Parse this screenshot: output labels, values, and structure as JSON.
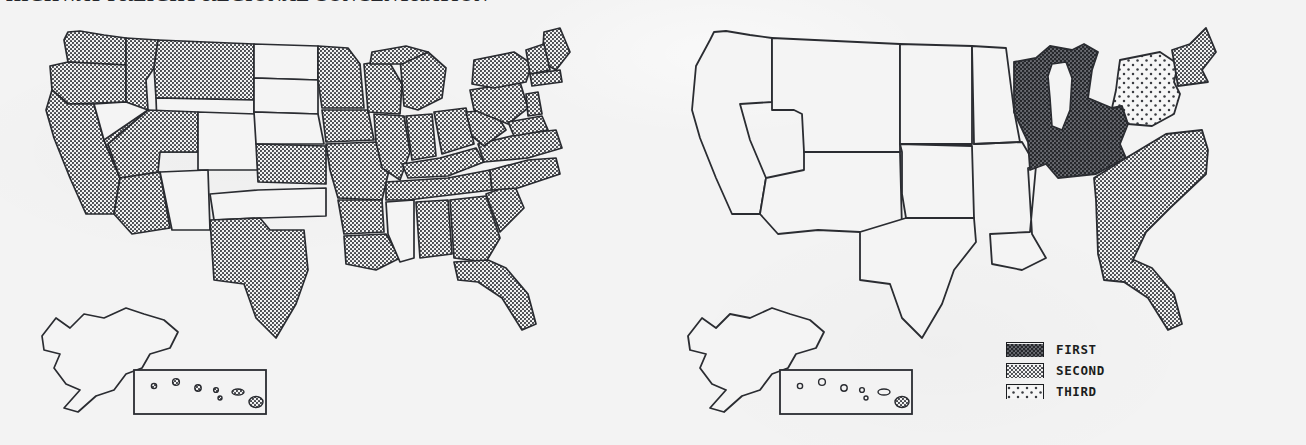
{
  "title": "HIGHWAY FREIGHT REGIONAL CONCENTRATION",
  "maps": [
    {
      "id": "map-all-regions",
      "name": "left-map",
      "description": "United States map with most states shaded in a uniform halftone dot pattern",
      "shaded_regions": [
        "Washington",
        "Oregon",
        "California",
        "Idaho",
        "Montana",
        "Arizona",
        "Utah",
        "Kansas",
        "Minnesota",
        "Iowa",
        "Missouri",
        "Arkansas",
        "Louisiana",
        "Texas",
        "Illinois",
        "Wisconsin",
        "Michigan",
        "Indiana",
        "Ohio",
        "Kentucky",
        "Tennessee",
        "Alabama",
        "Georgia",
        "Florida",
        "South Carolina",
        "North Carolina",
        "Virginia",
        "West Virginia",
        "Pennsylvania",
        "New York",
        "Maine",
        "Vermont",
        "New Hampshire",
        "Massachusetts",
        "New Jersey",
        "Maryland",
        "Delaware",
        "Connecticut",
        "Rhode Island",
        "Hawaii"
      ],
      "unshaded_regions": [
        "Nevada",
        "Wyoming",
        "Colorado",
        "New Mexico",
        "North Dakota",
        "South Dakota",
        "Nebraska",
        "Oklahoma",
        "Mississippi",
        "Alaska"
      ],
      "insets": [
        "Alaska",
        "Hawaii"
      ]
    },
    {
      "id": "map-ranked-regions",
      "name": "right-map",
      "description": "United States map with three ranked regions shaded by concentration order",
      "classified_regions": [
        {
          "rank": "FIRST",
          "pattern": "dense-dark-crosshatch",
          "area": "Great Lakes / East North Central"
        },
        {
          "rank": "SECOND",
          "pattern": "medium-dot",
          "area": "South Atlantic coast and Florida"
        },
        {
          "rank": "THIRD",
          "pattern": "sparse-dot",
          "area": "New York / Pennsylvania Mid-Atlantic"
        }
      ],
      "unshaded_regions": [
        "West",
        "Mountain",
        "Plains",
        "Alaska"
      ],
      "insets": [
        "Alaska",
        "Hawaii"
      ]
    }
  ],
  "legend": {
    "name": "concentration-rank-legend",
    "items": [
      {
        "label": "FIRST",
        "pattern": "dense-dark-crosshatch",
        "color": "#4d4f54"
      },
      {
        "label": "SECOND",
        "pattern": "medium-dot",
        "color": "#8e9096"
      },
      {
        "label": "THIRD",
        "pattern": "sparse-dot",
        "color": "#c9cbd0"
      }
    ]
  },
  "colors": {
    "background": "#f3f3f3",
    "ink": "#1b1d20",
    "outline": "#2a2c31",
    "shade_medium": "#8e9096",
    "shade_dark": "#4d4f54",
    "shade_light": "#c9cbd0"
  }
}
